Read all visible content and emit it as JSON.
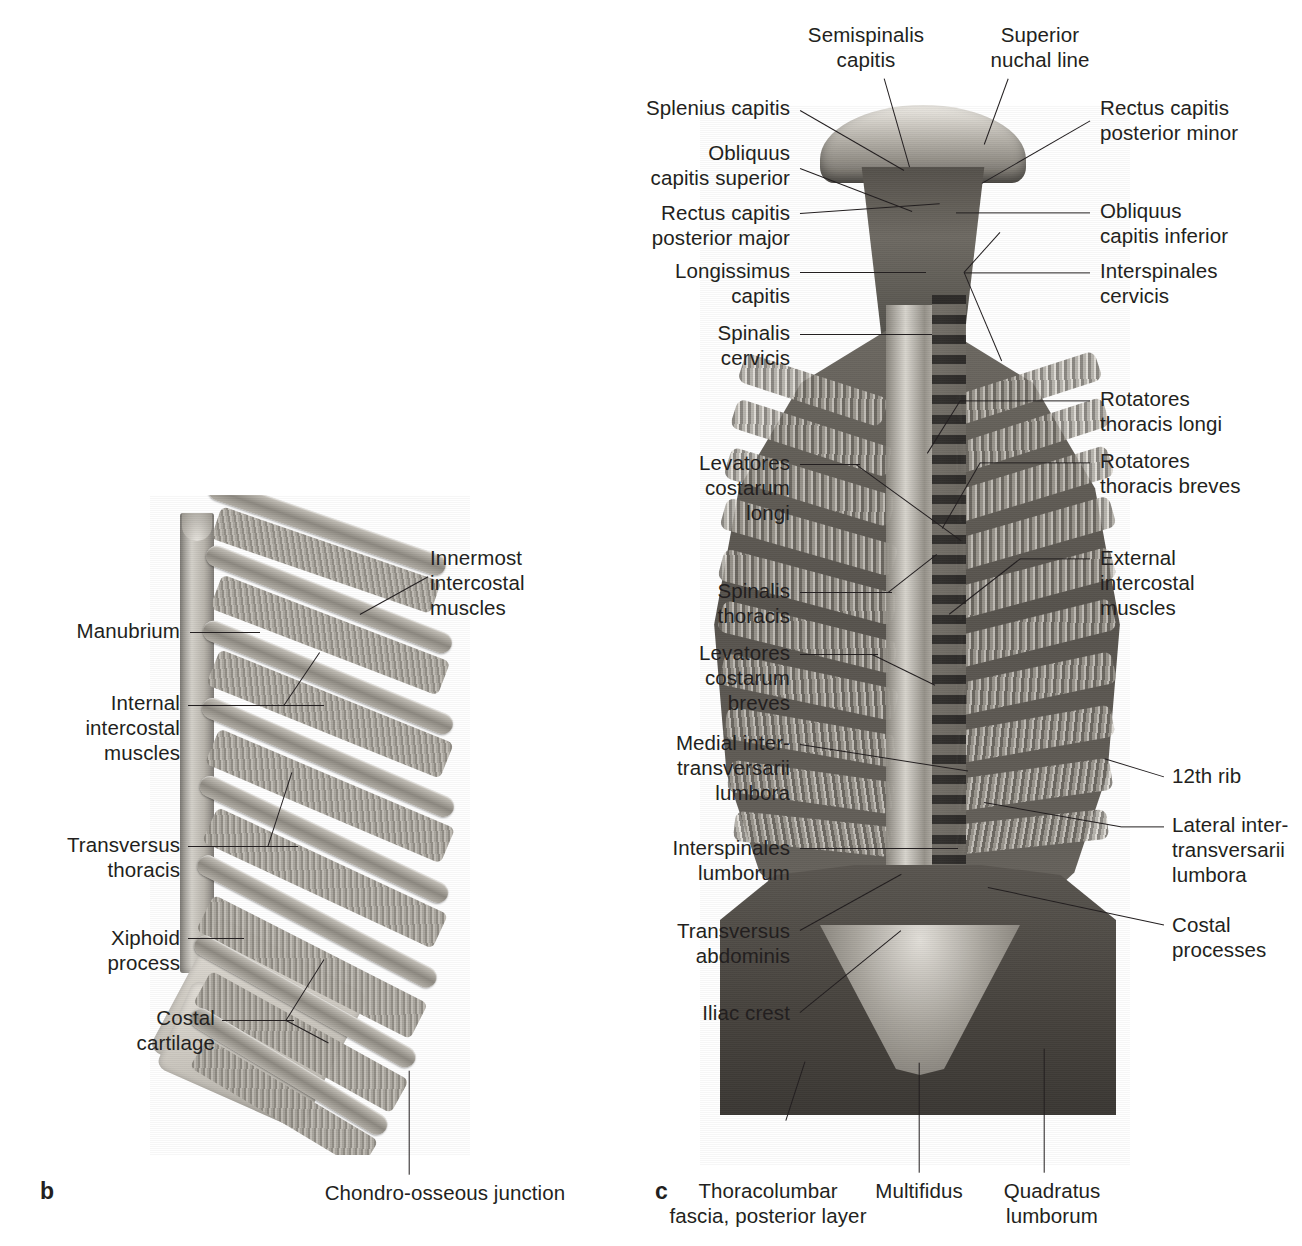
{
  "page": {
    "width": 1302,
    "height": 1246,
    "background": "#ffffff",
    "ink": "#231f20",
    "style": "grayscale anatomical atlas illustration with leader-line labels"
  },
  "panels": [
    {
      "letter": "b",
      "name": "thoracic-wall-internal-view",
      "title_visible": false
    },
    {
      "letter": "c",
      "name": "deep-back-muscles-posterior-view",
      "title_visible": false
    }
  ],
  "panel_b": {
    "letter": "b",
    "labels": [
      {
        "id": "manubrium",
        "text": "Manubrium",
        "align": "right"
      },
      {
        "id": "innermost-intercostal",
        "text": "Innermost\nintercostal\nmuscles",
        "align": "left"
      },
      {
        "id": "internal-intercostal",
        "text": "Internal\nintercostal\nmuscles",
        "align": "right"
      },
      {
        "id": "transversus-thoracis",
        "text": "Transversus\nthoracis",
        "align": "right"
      },
      {
        "id": "xiphoid-process",
        "text": "Xiphoid\nprocess",
        "align": "right"
      },
      {
        "id": "costal-cartilage",
        "text": "Costal\ncartilage",
        "align": "right"
      },
      {
        "id": "chondro-osseous",
        "text": "Chondro-osseous junction",
        "align": "center"
      }
    ]
  },
  "panel_c": {
    "letter": "c",
    "labels": [
      {
        "id": "semispinalis-capitis",
        "text": "Semispinalis\ncapitis",
        "align": "center"
      },
      {
        "id": "superior-nuchal-line",
        "text": "Superior\nnuchal line",
        "align": "center"
      },
      {
        "id": "splenius-capitis",
        "text": "Splenius capitis",
        "align": "right"
      },
      {
        "id": "obliquus-capitis-superior",
        "text": "Obliquus\ncapitis superior",
        "align": "right"
      },
      {
        "id": "rectus-capitis-posterior-major",
        "text": "Rectus capitis\nposterior major",
        "align": "right"
      },
      {
        "id": "longissimus-capitis",
        "text": "Longissimus\ncapitis",
        "align": "right"
      },
      {
        "id": "spinalis-cervicis",
        "text": "Spinalis\ncervicis",
        "align": "right"
      },
      {
        "id": "levatores-costarum-longi",
        "text": "Levatores\ncostarum\nlongi",
        "align": "right"
      },
      {
        "id": "spinalis-thoracis",
        "text": "Spinalis\nthoracis",
        "align": "right"
      },
      {
        "id": "levatores-costarum-breves",
        "text": "Levatores\ncostarum\nbreves",
        "align": "right"
      },
      {
        "id": "medial-intertransversarii",
        "text": "Medial inter-\ntransversarii\nlumbora",
        "align": "right"
      },
      {
        "id": "interspinales-lumborum",
        "text": "Interspinales\nlumborum",
        "align": "right"
      },
      {
        "id": "transversus-abdominis",
        "text": "Transversus\nabdominis",
        "align": "right"
      },
      {
        "id": "iliac-crest",
        "text": "Iliac crest",
        "align": "right"
      },
      {
        "id": "rectus-capitis-posterior-minor",
        "text": "Rectus capitis\nposterior minor",
        "align": "left"
      },
      {
        "id": "obliquus-capitis-inferior",
        "text": "Obliquus\ncapitis inferior",
        "align": "left"
      },
      {
        "id": "interspinales-cervicis",
        "text": "Interspinales\ncervicis",
        "align": "left"
      },
      {
        "id": "rotatores-thoracis-longi",
        "text": "Rotatores\nthoracis longi",
        "align": "left"
      },
      {
        "id": "rotatores-thoracis-breves",
        "text": "Rotatores\nthoracis breves",
        "align": "left"
      },
      {
        "id": "external-intercostal",
        "text": "External\nintercostal\nmuscles",
        "align": "left"
      },
      {
        "id": "twelfth-rib",
        "text": "12th rib",
        "align": "left"
      },
      {
        "id": "lateral-intertransversarii",
        "text": "Lateral inter-\ntransversarii\nlumbora",
        "align": "left"
      },
      {
        "id": "costal-processes",
        "text": "Costal\nprocesses",
        "align": "left"
      },
      {
        "id": "thoracolumbar-fascia",
        "text": "Thoracolumbar\nfascia, posterior layer",
        "align": "center"
      },
      {
        "id": "multifidus",
        "text": "Multifidus",
        "align": "center"
      },
      {
        "id": "quadratus-lumborum",
        "text": "Quadratus\nlumborum",
        "align": "center"
      }
    ]
  },
  "footer": {
    "caption_partial": "",
    "note": "bottom caption line is clipped by the image edge; only letter tops are visible"
  }
}
